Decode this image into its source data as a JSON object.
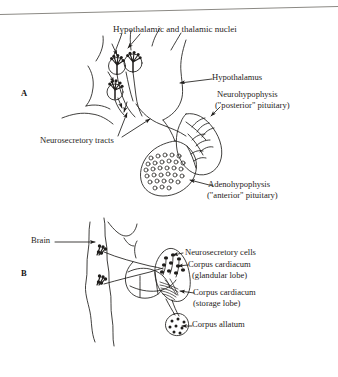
{
  "figure": {
    "type": "two-panel biological line diagram (scanned textbook page)",
    "background_color": "#ffffff",
    "ink_color": "#1f1d1b",
    "top_rule": "horizontal hairline across top of page"
  },
  "panels": [
    {
      "id": "A",
      "letter": "A",
      "subject": "Vertebrate hypothalamo-hypophyseal neurosecretory system",
      "labels": [
        {
          "name": "hypothalamic-and-thalamic-nuclei",
          "text": "Hypothalamic and thalamic nuclei"
        },
        {
          "name": "hypothalamus",
          "text": "Hypothalamus"
        },
        {
          "name": "neurohypophysis",
          "text": "Neurohypophysis"
        },
        {
          "name": "neurohypophysis-sub",
          "text": "(\"posterior\" pituitary)"
        },
        {
          "name": "neurosecretory-tracts",
          "text": "Neurosecretory tracts"
        },
        {
          "name": "adenohypophysis",
          "text": "Adenohypophysis"
        },
        {
          "name": "adenohypophysis-sub",
          "text": "(\"anterior\" pituitary)"
        }
      ]
    },
    {
      "id": "B",
      "letter": "B",
      "subject": "Insect brain, corpora cardiaca and corpus allatum",
      "labels": [
        {
          "name": "brain",
          "text": "Brain"
        },
        {
          "name": "neurosecretory-cells",
          "text": "Neurosecretory cells"
        },
        {
          "name": "corpus-cardiacum-glandular",
          "text": "Corpus cardiacum"
        },
        {
          "name": "corpus-cardiacum-glandular-sub",
          "text": "(glandular lobe)"
        },
        {
          "name": "corpus-cardiacum-storage",
          "text": "Corpus cardiacum"
        },
        {
          "name": "corpus-cardiacum-storage-sub",
          "text": "(storage lobe)"
        },
        {
          "name": "corpus-allatum",
          "text": "Corpus allatum"
        }
      ]
    }
  ]
}
